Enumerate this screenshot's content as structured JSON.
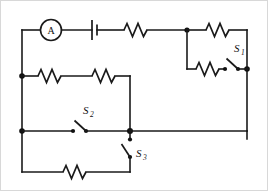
{
  "figure": {
    "name": "electric-circuit-diagram",
    "kind": "schematic",
    "width": 268,
    "height": 191,
    "background_color": "#ffffff",
    "line_color": "#1a1a1a",
    "frame_color": "#d8d8d8"
  },
  "components": {
    "ammeter": {
      "symbol_name": "ammeter-icon",
      "label": "A",
      "description": "circled letter A"
    },
    "battery": {
      "symbol_name": "battery-icon",
      "label": "",
      "description": "single cell, long and short plate"
    },
    "switches": [
      {
        "id": "s1",
        "label": "S",
        "subscript": "1",
        "state": "open",
        "orientation": "horizontal"
      },
      {
        "id": "s2",
        "label": "S",
        "subscript": "2",
        "state": "open",
        "orientation": "horizontal"
      },
      {
        "id": "s3",
        "label": "S",
        "subscript": "3",
        "state": "open",
        "orientation": "vertical"
      }
    ],
    "resistors": [
      {
        "id": "r-top-left",
        "label": "",
        "branch": "top-rail"
      },
      {
        "id": "r-top-right",
        "label": "",
        "branch": "top-right-upper"
      },
      {
        "id": "r-s1-branch",
        "label": "",
        "branch": "top-right-lower"
      },
      {
        "id": "r-mid-left",
        "label": "",
        "branch": "middle-left"
      },
      {
        "id": "r-mid-right",
        "label": "",
        "branch": "middle-right"
      },
      {
        "id": "r-bottom",
        "label": "",
        "branch": "bottom"
      }
    ],
    "junction_nodes": [
      {
        "id": "node-top-middle"
      },
      {
        "id": "node-right-mid"
      },
      {
        "id": "node-left-upper"
      },
      {
        "id": "node-left-lower"
      },
      {
        "id": "node-center"
      }
    ]
  }
}
